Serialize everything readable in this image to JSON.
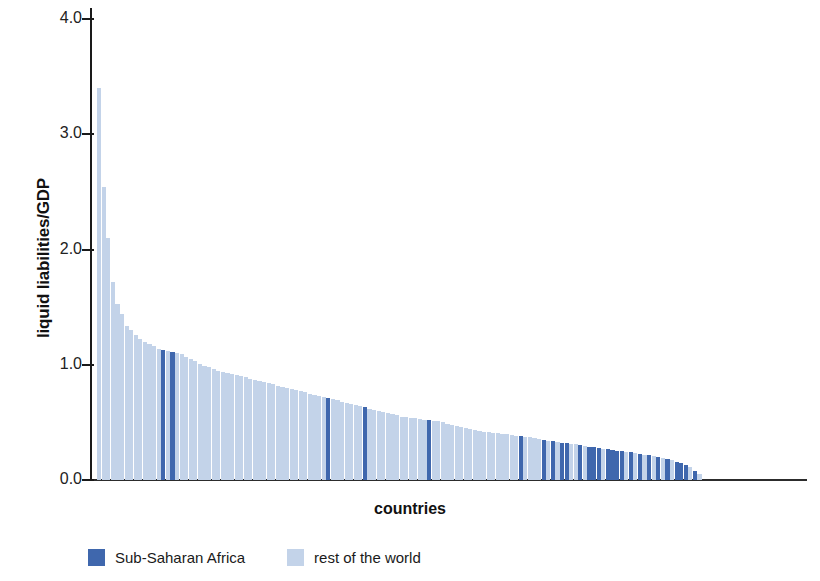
{
  "chart_data": {
    "type": "bar",
    "title": "",
    "xlabel": "countries",
    "ylabel": "liquid liabilities/GDP",
    "ylim": [
      0.0,
      4.0
    ],
    "yticks": [
      "0.0",
      "1.0",
      "2.0",
      "3.0",
      "4.0"
    ],
    "ytick_values": [
      0.0,
      1.0,
      2.0,
      3.0,
      4.0
    ],
    "grid": false,
    "legend_position": "bottom-left",
    "colors": {
      "sub_saharan_africa": "#3f67ad",
      "rest_of_world": "#c3d3e9",
      "axis": "#1a1a1a"
    },
    "legend": [
      {
        "label": "Sub-Saharan Africa",
        "color": "#3f67ad",
        "key": "ssa"
      },
      {
        "label": "rest of the world",
        "color": "#c3d3e9",
        "key": "row"
      }
    ],
    "note": "Each bar is one country, sorted descending by liquid liabilities/GDP. group 'ssa' = Sub-Saharan Africa (dark blue), 'row' = rest of the world (light blue).",
    "n_bars": 132,
    "values": [
      3.4,
      2.54,
      2.1,
      1.72,
      1.53,
      1.44,
      1.34,
      1.3,
      1.26,
      1.22,
      1.2,
      1.18,
      1.16,
      1.14,
      1.13,
      1.12,
      1.11,
      1.1,
      1.09,
      1.07,
      1.05,
      1.03,
      1.01,
      0.99,
      0.98,
      0.96,
      0.95,
      0.94,
      0.93,
      0.92,
      0.91,
      0.9,
      0.89,
      0.88,
      0.87,
      0.86,
      0.85,
      0.84,
      0.83,
      0.82,
      0.81,
      0.8,
      0.79,
      0.78,
      0.77,
      0.76,
      0.75,
      0.74,
      0.73,
      0.72,
      0.71,
      0.7,
      0.69,
      0.68,
      0.67,
      0.66,
      0.65,
      0.64,
      0.63,
      0.62,
      0.61,
      0.6,
      0.59,
      0.58,
      0.57,
      0.56,
      0.55,
      0.545,
      0.54,
      0.535,
      0.53,
      0.525,
      0.52,
      0.515,
      0.51,
      0.5,
      0.49,
      0.48,
      0.47,
      0.46,
      0.45,
      0.44,
      0.43,
      0.425,
      0.42,
      0.415,
      0.41,
      0.405,
      0.4,
      0.395,
      0.39,
      0.385,
      0.38,
      0.375,
      0.37,
      0.365,
      0.36,
      0.35,
      0.34,
      0.335,
      0.33,
      0.325,
      0.32,
      0.315,
      0.31,
      0.3,
      0.295,
      0.29,
      0.285,
      0.28,
      0.27,
      0.265,
      0.26,
      0.255,
      0.25,
      0.245,
      0.24,
      0.235,
      0.225,
      0.22,
      0.215,
      0.21,
      0.2,
      0.19,
      0.18,
      0.17,
      0.16,
      0.15,
      0.13,
      0.11,
      0.08,
      0.05
    ],
    "groups": [
      "row",
      "row",
      "row",
      "row",
      "row",
      "row",
      "row",
      "row",
      "row",
      "row",
      "row",
      "row",
      "row",
      "row",
      "ssa",
      "row",
      "ssa",
      "row",
      "row",
      "row",
      "row",
      "row",
      "row",
      "row",
      "row",
      "row",
      "row",
      "row",
      "row",
      "row",
      "row",
      "row",
      "row",
      "row",
      "row",
      "row",
      "row",
      "row",
      "row",
      "row",
      "row",
      "row",
      "row",
      "row",
      "row",
      "row",
      "row",
      "row",
      "row",
      "row",
      "ssa",
      "row",
      "row",
      "row",
      "row",
      "row",
      "row",
      "row",
      "ssa",
      "row",
      "row",
      "row",
      "row",
      "row",
      "row",
      "row",
      "row",
      "row",
      "row",
      "row",
      "row",
      "row",
      "ssa",
      "row",
      "row",
      "row",
      "row",
      "row",
      "row",
      "row",
      "row",
      "row",
      "row",
      "row",
      "row",
      "row",
      "row",
      "row",
      "row",
      "row",
      "row",
      "row",
      "ssa",
      "row",
      "row",
      "row",
      "row",
      "ssa",
      "row",
      "ssa",
      "row",
      "ssa",
      "ssa",
      "row",
      "row",
      "ssa",
      "row",
      "ssa",
      "ssa",
      "ssa",
      "row",
      "ssa",
      "ssa",
      "ssa",
      "ssa",
      "row",
      "ssa",
      "row",
      "ssa",
      "row",
      "ssa",
      "row",
      "ssa",
      "row",
      "ssa",
      "row",
      "ssa",
      "ssa",
      "ssa",
      "row",
      "ssa",
      "row"
    ]
  }
}
